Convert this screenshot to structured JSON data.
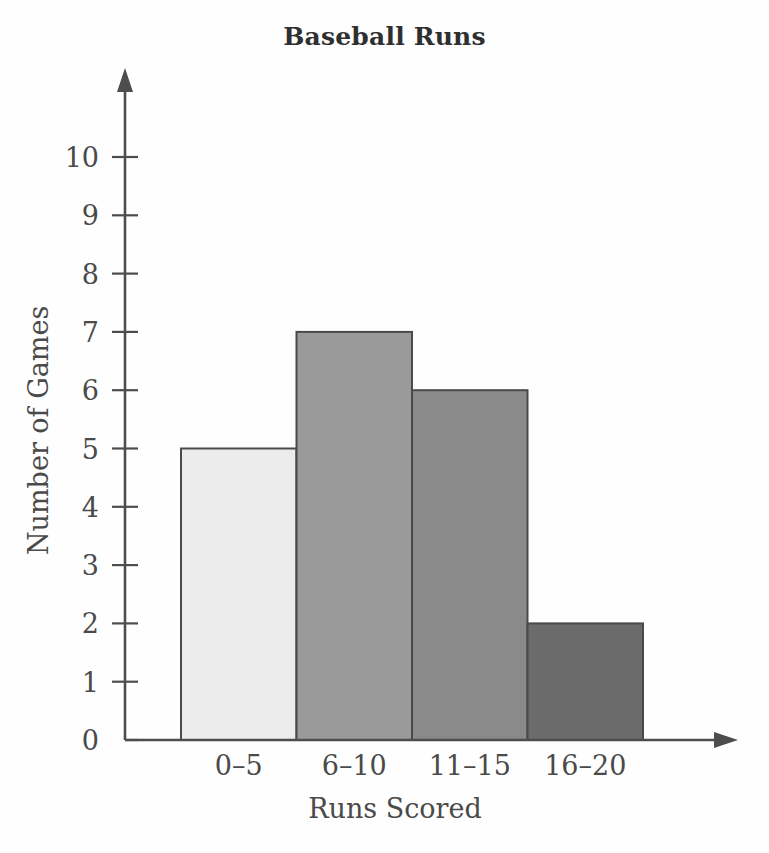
{
  "chart_data": {
    "type": "bar",
    "title": "Baseball Runs",
    "xlabel": "Runs Scored",
    "ylabel": "Number of Games",
    "categories": [
      "0–5",
      "6–10",
      "11–15",
      "16–20"
    ],
    "values": [
      5,
      7,
      6,
      2
    ],
    "ylim": [
      0,
      10
    ],
    "yticks": [
      0,
      1,
      2,
      3,
      4,
      5,
      6,
      7,
      8,
      9,
      10
    ],
    "ytick_labels": [
      "0",
      "1",
      "2",
      "3",
      "4",
      "5",
      "6",
      "7",
      "8",
      "9",
      "10"
    ],
    "grid": false,
    "legend": "none",
    "bar_gap": 0,
    "bar_colors": [
      "#ececec",
      "#9a9a9a",
      "#8a8a8a",
      "#6b6b6b"
    ],
    "bar_edge_color": "#4a4a4a",
    "axis_color": "#4d4d4d",
    "axis_arrows": true,
    "background_color": "#fefefe",
    "text_color": "#4a4a4a"
  }
}
